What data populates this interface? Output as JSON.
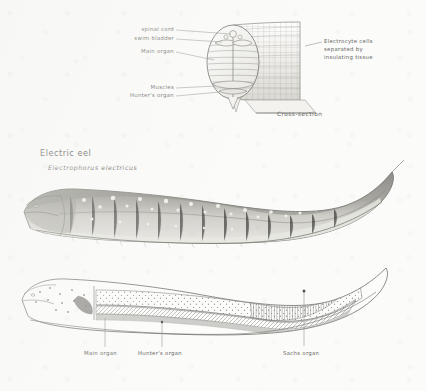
{
  "plate": {
    "title": "Electric eel",
    "subtitle": "Electrophorus electricus",
    "caption": "Cross-section"
  },
  "cross_section_labels": {
    "left": [
      {
        "text": "spinal cord"
      },
      {
        "text": "swim bladder"
      },
      {
        "text": "Main organ"
      },
      {
        "text": "Muscles"
      },
      {
        "text": "Hunter's organ"
      }
    ],
    "right": {
      "line1": "Electrocyte cells",
      "line2": "separated by",
      "line3": "insulating tissue"
    }
  },
  "schematic_labels": [
    {
      "text": "Main organ"
    },
    {
      "text": "Hunter's organ"
    },
    {
      "text": "Sachs organ"
    }
  ],
  "palette": {
    "paper": "#fbfbfa",
    "ink": "#7c7c77",
    "text": "#6a6a66",
    "body_light": "#e9e8e4",
    "body_mid": "#b9b8b2",
    "body_dark": "#8b8a84"
  }
}
